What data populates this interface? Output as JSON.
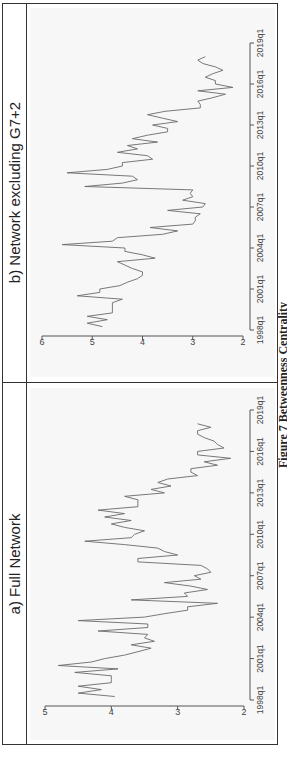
{
  "figure": {
    "caption": "Figure 7 Betweenness Centrality"
  },
  "chart_data": [
    {
      "type": "line",
      "title": "a) Full Network",
      "xlabel": "",
      "ylabel": "",
      "ylim": [
        2,
        5
      ],
      "yticks": [
        "2",
        "3",
        "4",
        "5"
      ],
      "xticks": [
        "1998q1",
        "2001q1",
        "2004q1",
        "2007q1",
        "2010q1",
        "2013q1",
        "2016q1",
        "2019q1"
      ],
      "xrange": [
        "1998q1",
        "2019q1"
      ],
      "grid": false,
      "series": [
        {
          "name": "Betweenness Centrality (Full Network)",
          "x": [
            1998.25,
            1998.5,
            1998.75,
            1999.0,
            1999.25,
            1999.5,
            1999.75,
            2000.0,
            2000.25,
            2000.5,
            2000.75,
            2001.0,
            2001.25,
            2001.5,
            2001.75,
            2002.0,
            2002.25,
            2002.5,
            2002.75,
            2003.0,
            2003.25,
            2003.5,
            2003.75,
            2004.0,
            2004.25,
            2004.5,
            2004.75,
            2005.0,
            2005.25,
            2005.5,
            2005.75,
            2006.0,
            2006.25,
            2006.5,
            2006.75,
            2007.0,
            2007.25,
            2007.5,
            2007.75,
            2008.0,
            2008.25,
            2008.5,
            2008.75,
            2009.0,
            2009.25,
            2009.5,
            2009.75,
            2010.0,
            2010.25,
            2010.5,
            2010.75,
            2011.0,
            2011.25,
            2011.5,
            2011.75,
            2012.0,
            2012.25,
            2012.5,
            2012.75,
            2013.0,
            2013.25,
            2013.5,
            2013.75,
            2014.0,
            2014.25,
            2014.5,
            2014.75,
            2015.0,
            2015.25,
            2015.5,
            2015.75,
            2016.0,
            2016.25,
            2016.5,
            2016.75,
            2017.0,
            2017.25,
            2017.5,
            2017.75,
            2018.0
          ],
          "values": [
            3.95,
            4.5,
            4.15,
            4.5,
            4.0,
            4.0,
            4.0,
            4.55,
            3.9,
            4.8,
            4.3,
            4.1,
            3.8,
            3.6,
            3.4,
            3.7,
            3.35,
            3.5,
            3.45,
            4.2,
            3.45,
            3.45,
            4.5,
            3.5,
            3.2,
            2.85,
            2.85,
            2.4,
            3.7,
            2.85,
            2.9,
            2.55,
            2.8,
            3.2,
            2.65,
            2.75,
            2.5,
            2.55,
            2.65,
            3.6,
            3.6,
            3.0,
            3.2,
            3.3,
            3.8,
            4.4,
            3.7,
            3.65,
            3.5,
            3.8,
            4.0,
            3.7,
            4.1,
            3.8,
            4.2,
            3.6,
            3.6,
            3.6,
            3.8,
            3.2,
            3.4,
            3.1,
            3.3,
            3.15,
            2.7,
            2.8,
            2.8,
            2.4,
            2.6,
            2.2,
            2.7,
            2.7,
            2.3,
            2.4,
            2.45,
            2.6,
            2.7,
            2.7,
            2.5,
            2.7
          ]
        }
      ]
    },
    {
      "type": "line",
      "title": "b) Network excluding G7+2",
      "xlabel": "",
      "ylabel": "",
      "ylim": [
        2,
        6
      ],
      "yticks": [
        "2",
        "3",
        "4",
        "5",
        "6"
      ],
      "xticks": [
        "1998q1",
        "2001q1",
        "2004q1",
        "2007q1",
        "2010q1",
        "2013q1",
        "2016q1",
        "2019q1"
      ],
      "xrange": [
        "1998q1",
        "2019q1"
      ],
      "grid": false,
      "series": [
        {
          "name": "Betweenness Centrality (excluding G7+2)",
          "x": [
            1998.25,
            1998.5,
            1998.75,
            1999.0,
            1999.25,
            1999.5,
            1999.75,
            2000.0,
            2000.25,
            2000.5,
            2000.75,
            2001.0,
            2001.25,
            2001.5,
            2001.75,
            2002.0,
            2002.25,
            2002.5,
            2002.75,
            2003.0,
            2003.25,
            2003.5,
            2003.75,
            2004.0,
            2004.25,
            2004.5,
            2004.75,
            2005.0,
            2005.25,
            2005.5,
            2005.75,
            2006.0,
            2006.25,
            2006.5,
            2006.75,
            2007.0,
            2007.25,
            2007.5,
            2007.75,
            2008.0,
            2008.25,
            2008.5,
            2008.75,
            2009.0,
            2009.25,
            2009.5,
            2009.75,
            2010.0,
            2010.25,
            2010.5,
            2010.75,
            2011.0,
            2011.25,
            2011.5,
            2011.75,
            2012.0,
            2012.25,
            2012.5,
            2012.75,
            2013.0,
            2013.25,
            2013.5,
            2013.75,
            2014.0,
            2014.25,
            2014.5,
            2014.75,
            2015.0,
            2015.25,
            2015.5,
            2015.75,
            2016.0,
            2016.25,
            2016.5,
            2016.75,
            2017.0,
            2017.25,
            2017.5,
            2017.75,
            2018.0
          ],
          "values": [
            4.8,
            5.1,
            4.7,
            5.1,
            4.6,
            4.6,
            4.6,
            4.6,
            4.4,
            5.3,
            4.85,
            4.85,
            4.45,
            4.3,
            4.1,
            4.0,
            4.0,
            4.2,
            4.35,
            4.5,
            3.75,
            4.0,
            4.35,
            4.35,
            5.6,
            4.6,
            4.5,
            3.6,
            3.3,
            3.85,
            3.0,
            2.95,
            2.95,
            2.85,
            3.5,
            2.8,
            2.75,
            3.2,
            3.0,
            3.05,
            3.0,
            5.15,
            4.4,
            4.1,
            4.2,
            5.5,
            4.7,
            4.4,
            4.4,
            3.8,
            3.9,
            4.5,
            4.1,
            4.3,
            3.7,
            4.2,
            3.9,
            3.5,
            3.5,
            3.8,
            3.3,
            3.6,
            3.9,
            3.55,
            2.85,
            2.85,
            2.9,
            2.6,
            2.35,
            2.9,
            2.2,
            2.55,
            2.55,
            2.75,
            2.6,
            2.4,
            2.55,
            2.8,
            2.9,
            2.75
          ]
        }
      ]
    }
  ]
}
